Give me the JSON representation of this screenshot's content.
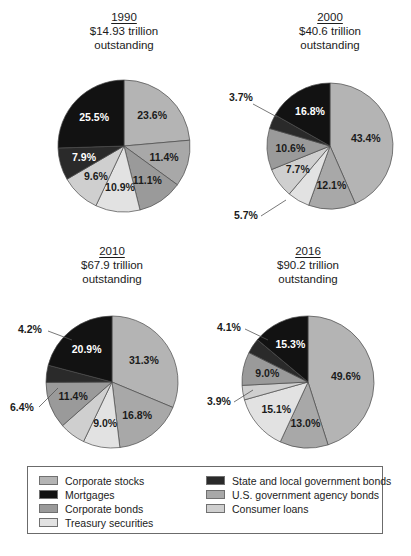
{
  "colors": {
    "corporate_stocks": "#b4b4b4",
    "mortgages": "#121212",
    "corporate_bonds": "#9a9a9a",
    "treasury_securities": "#e2e2e2",
    "state_local_bonds": "#2a2a2a",
    "us_agency_bonds": "#a8a8a8",
    "consumer_loans": "#cfcfcf",
    "outline": "#4a4a4a",
    "text": "#1b1b1b",
    "legend_border": "#6b6b6b"
  },
  "legend": {
    "left_column": [
      {
        "label": "Corporate stocks",
        "color_key": "corporate_stocks"
      },
      {
        "label": "Mortgages",
        "color_key": "mortgages"
      },
      {
        "label": "Corporate bonds",
        "color_key": "corporate_bonds"
      },
      {
        "label": "Treasury securities",
        "color_key": "treasury_securities"
      }
    ],
    "right_column": [
      {
        "label": "State and local government bonds",
        "color_key": "state_local_bonds"
      },
      {
        "label": "U.S. government agency bonds",
        "color_key": "us_agency_bonds"
      },
      {
        "label": "Consumer loans",
        "color_key": "consumer_loans"
      }
    ]
  },
  "source_note": "",
  "chart_data": [
    {
      "type": "pie",
      "title": "1990",
      "subtitle_line1": "$14.93 trillion",
      "subtitle_line2": "outstanding",
      "labels": [
        "Corporate stocks",
        "U.S. government agency bonds",
        "Corporate bonds",
        "Treasury securities",
        "Consumer loans",
        "State and local government bonds",
        "Mortgages"
      ],
      "values": [
        23.6,
        11.4,
        11.1,
        10.9,
        9.6,
        7.9,
        25.5
      ],
      "value_labels": [
        "23.6%",
        "11.4%",
        "11.1%",
        "10.9%",
        "9.6%",
        "7.9%",
        "25.5%"
      ],
      "callouts": []
    },
    {
      "type": "pie",
      "title": "2000",
      "subtitle_line1": "$40.6 trillion",
      "subtitle_line2": "outstanding",
      "labels": [
        "Corporate stocks",
        "U.S. government agency bonds",
        "Treasury securities",
        "Consumer loans",
        "Corporate bonds",
        "State and local government bonds",
        "Mortgages"
      ],
      "values": [
        43.4,
        12.1,
        5.7,
        7.7,
        10.6,
        3.7,
        16.8
      ],
      "value_labels": [
        "43.4%",
        "12.1%",
        "5.7%",
        "7.7%",
        "10.6%",
        "3.7%",
        "16.8%"
      ],
      "callouts": [
        "5.7%",
        "3.7%"
      ]
    },
    {
      "type": "pie",
      "title": "2010",
      "subtitle_line1": "$67.9 trillion",
      "subtitle_line2": "outstanding",
      "labels": [
        "Corporate stocks",
        "U.S. government agency bonds",
        "Treasury securities",
        "Consumer loans",
        "Corporate bonds",
        "State and local government bonds",
        "Mortgages"
      ],
      "values": [
        31.3,
        16.8,
        9.0,
        6.4,
        11.4,
        4.2,
        20.9
      ],
      "value_labels": [
        "31.3%",
        "16.8%",
        "9.0%",
        "6.4%",
        "11.4%",
        "4.2%",
        "20.9%"
      ],
      "callouts": [
        "6.4%",
        "4.2%"
      ]
    },
    {
      "type": "pie",
      "title": "2016",
      "subtitle_line1": "$90.2 trillion",
      "subtitle_line2": "outstanding",
      "labels": [
        "Corporate stocks",
        "U.S. government agency bonds",
        "Treasury securities",
        "Consumer loans",
        "Corporate bonds",
        "State and local government bonds",
        "Mortgages"
      ],
      "values": [
        49.6,
        13.0,
        15.1,
        3.9,
        9.0,
        4.1,
        15.3
      ],
      "value_labels": [
        "49.6%",
        "13.0%",
        "15.1%",
        "3.9%",
        "9.0%",
        "4.1%",
        "15.3%"
      ],
      "callouts": [
        "3.9%",
        "4.1%"
      ]
    }
  ],
  "panels": [
    {
      "cx": 124,
      "cy": 146,
      "r": 66,
      "title_top": 14
    },
    {
      "cx": 330,
      "cy": 146,
      "r": 63,
      "title_top": 14
    },
    {
      "cx": 112,
      "cy": 382,
      "r": 66,
      "title_top": 248
    },
    {
      "cx": 308,
      "cy": 382,
      "r": 66,
      "title_top": 248
    }
  ]
}
